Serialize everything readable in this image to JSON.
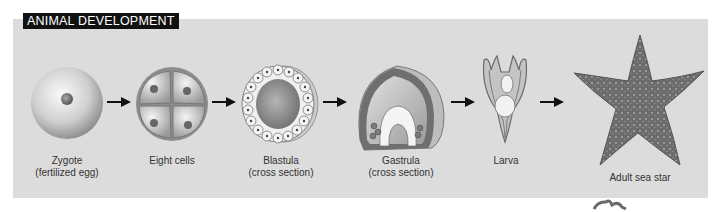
{
  "title": "ANIMAL DEVELOPMENT",
  "stages": [
    {
      "name": "Zygote",
      "sub": "(fertilized egg)"
    },
    {
      "name": "Eight cells",
      "sub": ""
    },
    {
      "name": "Blastula",
      "sub": "(cross section)"
    },
    {
      "name": "Gastrula",
      "sub": "(cross section)"
    },
    {
      "name": "Larva",
      "sub": ""
    },
    {
      "name": "Adult sea star",
      "sub": ""
    }
  ],
  "colors": {
    "panel": "#dcdcdc",
    "title_bg": "#111111",
    "title_fg": "#ffffff",
    "arrow": "#111111"
  }
}
